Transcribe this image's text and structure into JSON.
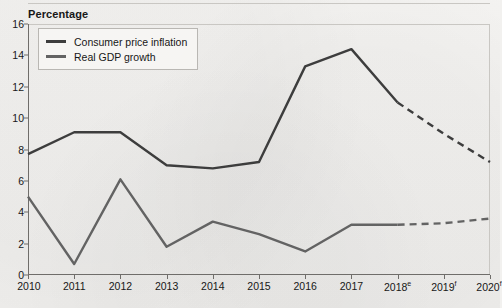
{
  "axis_title": "Percentage",
  "legend": {
    "items": [
      {
        "label": "Consumer price inflation",
        "color": "#3d3d3d",
        "icon": "line-swatch-icon"
      },
      {
        "label": "Real GDP growth",
        "color": "#636363",
        "icon": "line-swatch-icon"
      }
    ]
  },
  "chart_data": {
    "type": "line",
    "title": "",
    "subtitle": "",
    "xlabel": "",
    "ylabel": "Percentage",
    "ylim": [
      0,
      16
    ],
    "ytick_labels": [
      "0",
      "2",
      "4",
      "6",
      "8",
      "10",
      "12",
      "14",
      "16"
    ],
    "yticks": [
      0,
      2,
      4,
      6,
      8,
      10,
      12,
      14,
      16
    ],
    "grid": false,
    "legend_position": "top-left",
    "x": [
      2010,
      2011,
      2012,
      2013,
      2014,
      2015,
      2016,
      2017,
      2018,
      2019,
      2020
    ],
    "categories": [
      "2010",
      "2011",
      "2012",
      "2013",
      "2014",
      "2015",
      "2016",
      "2017",
      "2018",
      "2019",
      "2020"
    ],
    "xtick_labels": [
      "2010",
      "2011",
      "2012",
      "2013",
      "2014",
      "2015",
      "2016",
      "2017",
      "2018",
      "2019",
      "2020"
    ],
    "xtick_superscripts": [
      "",
      "",
      "",
      "",
      "",
      "",
      "",
      "",
      "e",
      "f",
      "f"
    ],
    "forecast_from_index": 8,
    "series": [
      {
        "name": "Consumer price inflation",
        "color": "#3d3d3d",
        "values": [
          7.7,
          9.1,
          9.1,
          7.0,
          6.8,
          7.2,
          13.3,
          14.4,
          11.0,
          9.0,
          7.2
        ],
        "solid_until_index": 8,
        "dashed_from_index": 8
      },
      {
        "name": "Real GDP growth",
        "color": "#636363",
        "values": [
          5.0,
          0.7,
          6.1,
          1.8,
          3.4,
          2.6,
          1.5,
          3.2,
          3.2,
          3.3,
          3.6
        ],
        "solid_until_index": 8,
        "dashed_from_index": 8
      }
    ],
    "annotations": [
      {
        "text": "e = estimate",
        "attached_to": "2018"
      },
      {
        "text": "f = forecast",
        "attached_to": "2019, 2020"
      }
    ]
  }
}
